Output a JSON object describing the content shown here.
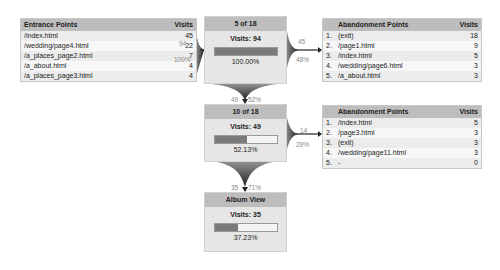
{
  "entrance": {
    "title": "Entrance Points",
    "col": "Visits",
    "rows": [
      {
        "page": "/index.html",
        "visits": "45"
      },
      {
        "page": "/wedding/page4.html",
        "visits": "22"
      },
      {
        "page": "/a_places_page2.html",
        "visits": "7"
      },
      {
        "page": "/a_about.html",
        "visits": "4"
      },
      {
        "page": "/a_places_page3.html",
        "visits": "4"
      }
    ],
    "flow_count": "94",
    "flow_pct": "100%"
  },
  "steps": [
    {
      "title": "5 of 18",
      "visits": "Visits: 94",
      "pct": "100.00%",
      "fill": 100,
      "exit_count": "45",
      "exit_pct": "48%",
      "next_count": "49",
      "next_pct": "52%"
    },
    {
      "title": "10 of 18",
      "visits": "Visits: 49",
      "pct": "52.13%",
      "fill": 52.13,
      "exit_count": "14",
      "exit_pct": "29%",
      "next_count": "35",
      "next_pct": "71%"
    },
    {
      "title": "Album View",
      "visits": "Visits: 35",
      "pct": "37.23%",
      "fill": 37.23
    }
  ],
  "abandonment": [
    {
      "title": "Abandonment Points",
      "col": "Visits",
      "rows": [
        {
          "n": "1.",
          "page": "(exit)",
          "visits": "18"
        },
        {
          "n": "2.",
          "page": "/page1.html",
          "visits": "9"
        },
        {
          "n": "3.",
          "page": "/index.html",
          "visits": "5"
        },
        {
          "n": "4.",
          "page": "/wedding/page6.html",
          "visits": "3"
        },
        {
          "n": "5.",
          "page": "/a_about.html",
          "visits": "3"
        }
      ]
    },
    {
      "title": "Abandonment Points",
      "col": "Visits",
      "rows": [
        {
          "n": "1.",
          "page": "/index.html",
          "visits": "5"
        },
        {
          "n": "2.",
          "page": "/page3.html",
          "visits": "3"
        },
        {
          "n": "3.",
          "page": "(exit)",
          "visits": "3"
        },
        {
          "n": "4.",
          "page": "/wedding/page11.html",
          "visits": "3"
        },
        {
          "n": "5.",
          "page": "-",
          "visits": "0"
        }
      ]
    }
  ]
}
